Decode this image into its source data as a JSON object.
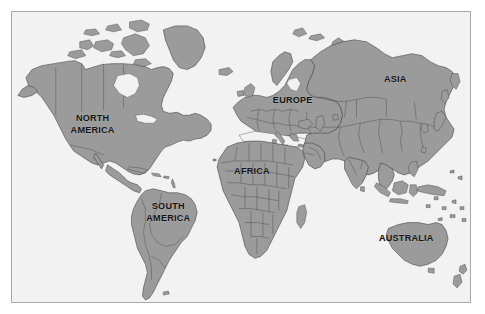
{
  "figure": {
    "type": "world-map",
    "projection_note": "equirectangular-like world map, continents shaded",
    "colors": {
      "page_background": "#ffffff",
      "ocean_background": "#f2f2f2",
      "land_fill": "#9b9b9b",
      "coast_stroke": "#3c3c3c",
      "country_border_stroke": "#4a4a4a",
      "frame_border": "#a8a8a8",
      "label_text": "#141414"
    },
    "frame": {
      "x": 11,
      "y": 11,
      "width": 460,
      "height": 292
    }
  },
  "labels": [
    {
      "id": "north-america",
      "text": "NORTH",
      "x": 92,
      "y": 118
    },
    {
      "id": "north-america-2",
      "text": "AMERICA",
      "x": 92,
      "y": 130
    },
    {
      "id": "south-america",
      "text": "SOUTH",
      "x": 168,
      "y": 207
    },
    {
      "id": "south-america-2",
      "text": "AMERICA",
      "x": 168,
      "y": 219
    },
    {
      "id": "europe",
      "text": "EUROPE",
      "x": 293,
      "y": 100
    },
    {
      "id": "africa",
      "text": "AFRICA",
      "x": 252,
      "y": 172
    },
    {
      "id": "asia",
      "text": "ASIA",
      "x": 396,
      "y": 79
    },
    {
      "id": "australia",
      "text": "AUSTRALIA",
      "x": 407,
      "y": 239
    }
  ],
  "continents": [
    "NORTH AMERICA",
    "SOUTH AMERICA",
    "EUROPE",
    "AFRICA",
    "ASIA",
    "AUSTRALIA"
  ]
}
